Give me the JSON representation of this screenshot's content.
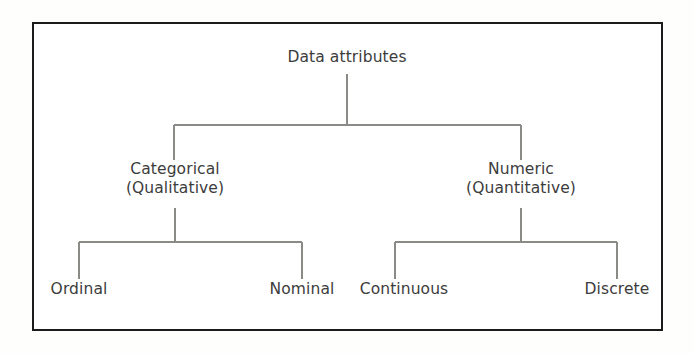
{
  "figure": {
    "kind": "hierarchy-tree",
    "frame": {
      "border_color": "#1b1b1b",
      "background": "#ffffff"
    },
    "text_color": "#3c3c3c",
    "edge_color": "#8a8a86"
  },
  "tree": {
    "root": {
      "id": "data-attributes",
      "label": "Data attributes",
      "cx": 347,
      "baseline_y": 68
    },
    "level1": [
      {
        "id": "categorical",
        "line1": "Categorical",
        "line2": "(Qualitative)",
        "cx": 175,
        "top_y": 160
      },
      {
        "id": "numeric",
        "line1": "Numeric",
        "line2": "(Quantitative)",
        "cx": 521,
        "top_y": 160
      }
    ],
    "level2": [
      {
        "id": "ordinal",
        "label": "Ordinal",
        "cx": 79,
        "parent": "categorical",
        "baseline_y": 295
      },
      {
        "id": "nominal",
        "label": "Nominal",
        "cx": 302,
        "parent": "categorical",
        "baseline_y": 295
      },
      {
        "id": "continuous",
        "label": "Continuous",
        "cx": 395,
        "parent": "numeric",
        "baseline_y": 295
      },
      {
        "id": "discrete",
        "label": "Discrete",
        "cx": 617,
        "parent": "numeric",
        "baseline_y": 295
      }
    ]
  },
  "edges": {
    "root_stem": {
      "x": 347,
      "y1": 74,
      "y2": 125
    },
    "level1_bar": {
      "y": 125,
      "x1": 174,
      "x2": 521
    },
    "cat_drop": {
      "x": 174,
      "y1": 125,
      "y2": 160
    },
    "num_drop": {
      "x": 521,
      "y1": 125,
      "y2": 160
    },
    "cat_stem": {
      "x": 175,
      "y1": 208,
      "y2": 242
    },
    "num_stem": {
      "x": 521,
      "y1": 208,
      "y2": 242
    },
    "left_bar": {
      "y": 242,
      "x1": 79,
      "x2": 302
    },
    "right_bar": {
      "y": 242,
      "x1": 395,
      "x2": 617
    },
    "ordinal_drop": {
      "x": 79,
      "y1": 242,
      "y2": 279
    },
    "nominal_drop": {
      "x": 302,
      "y1": 242,
      "y2": 279
    },
    "continuous_drop": {
      "x": 395,
      "y1": 242,
      "y2": 279
    },
    "discrete_drop": {
      "x": 617,
      "y1": 242,
      "y2": 279
    }
  }
}
